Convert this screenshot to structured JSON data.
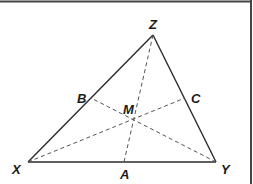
{
  "diagram": {
    "frame": {
      "stroke": "#444444"
    },
    "colors": {
      "solid": "#2a2a2a",
      "dashed": "#555555",
      "label": "#1a1a1a"
    },
    "points": {
      "X": {
        "label": "X",
        "x": 28,
        "y": 162,
        "lx": 13,
        "ly": 174
      },
      "Y": {
        "label": "Y",
        "x": 216,
        "y": 162,
        "lx": 221,
        "ly": 174
      },
      "Z": {
        "label": "Z",
        "x": 153,
        "y": 35,
        "lx": 149,
        "ly": 29
      },
      "A": {
        "label": "A",
        "x": 124,
        "y": 162,
        "lx": 120,
        "ly": 178
      },
      "B": {
        "label": "B",
        "x": 91,
        "y": 98,
        "lx": 77,
        "ly": 102
      },
      "C": {
        "label": "C",
        "x": 185,
        "y": 98,
        "lx": 191,
        "ly": 102
      },
      "M": {
        "label": "M",
        "x": 133,
        "y": 119,
        "lx": 124,
        "ly": 114
      }
    },
    "sides": [
      {
        "from": "X",
        "to": "Y",
        "style": "solid"
      },
      {
        "from": "Y",
        "to": "Z",
        "style": "solid"
      },
      {
        "from": "Z",
        "to": "X",
        "style": "solid"
      }
    ],
    "medians": [
      {
        "from": "Z",
        "to": "A",
        "style": "dashed"
      },
      {
        "from": "X",
        "to": "C",
        "style": "dashed"
      },
      {
        "from": "Y",
        "to": "B",
        "style": "dashed"
      }
    ]
  }
}
